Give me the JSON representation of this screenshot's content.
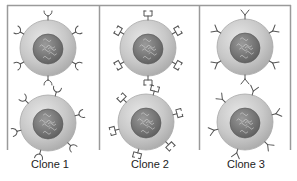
{
  "figure": {
    "panels": [
      {
        "label": "Clone 1",
        "receptor_type": "curled-hook",
        "cells": [
          {
            "cx": 48,
            "cy": 48
          },
          {
            "cx": 48,
            "cy": 123
          }
        ]
      },
      {
        "label": "Clone 2",
        "receptor_type": "square-bracket",
        "cells": [
          {
            "cx": 148,
            "cy": 48
          },
          {
            "cx": 146,
            "cy": 122
          }
        ]
      },
      {
        "label": "Clone 3",
        "receptor_type": "straight-y",
        "cells": [
          {
            "cx": 245,
            "cy": 47
          },
          {
            "cx": 245,
            "cy": 122
          }
        ]
      }
    ],
    "colors": {
      "frame": "#9a9a9a",
      "cell_fill": "#c9c9c9",
      "cell_edge": "#a8a8a8",
      "nucleus": "#7a7a7a",
      "receptor": "#555555",
      "label": "#222222"
    }
  }
}
